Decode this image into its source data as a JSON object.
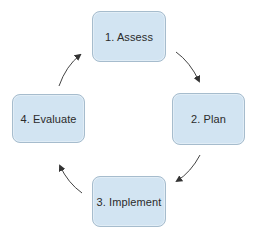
{
  "diagram": {
    "type": "cycle",
    "colors": {
      "node_fill": "#d2e4f2",
      "node_border": "#a6bccd",
      "text": "#2b2b2b",
      "arrow": "#333333"
    },
    "nodes": [
      {
        "id": "assess",
        "label": "1. Assess",
        "position": "top"
      },
      {
        "id": "plan",
        "label": "2. Plan",
        "position": "right"
      },
      {
        "id": "implement",
        "label": "3. Implement",
        "position": "bottom"
      },
      {
        "id": "evaluate",
        "label": "4. Evaluate",
        "position": "left"
      }
    ],
    "edges": [
      {
        "from": "assess",
        "to": "plan",
        "direction": "clockwise"
      },
      {
        "from": "plan",
        "to": "implement",
        "direction": "clockwise"
      },
      {
        "from": "implement",
        "to": "evaluate",
        "direction": "clockwise"
      },
      {
        "from": "evaluate",
        "to": "assess",
        "direction": "clockwise"
      }
    ]
  }
}
